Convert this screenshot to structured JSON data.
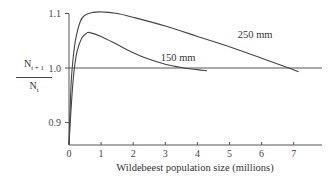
{
  "chart_data": {
    "type": "line",
    "title": "",
    "xlabel": "Wildebeest population size (millions)",
    "ylabel": {
      "numerator": "N",
      "numerator_sub": "t + 1",
      "denominator": "N",
      "denominator_sub": "t"
    },
    "xlim": [
      0,
      8
    ],
    "ylim": [
      0.86,
      1.1
    ],
    "xticks": [
      "0",
      "1",
      "2",
      "3",
      "4",
      "5",
      "6",
      "7"
    ],
    "yticks": [
      "0.9",
      "1.0",
      "1.1"
    ],
    "grid": false,
    "reference_line": {
      "y": 1.0,
      "x_range": [
        0,
        8
      ]
    },
    "series": [
      {
        "name": "250 mm",
        "x": [
          0,
          0.05,
          0.1,
          0.2,
          0.35,
          0.5,
          0.75,
          1.0,
          1.5,
          2.0,
          3.0,
          4.0,
          5.0,
          6.0,
          6.85,
          7.15
        ],
        "y": [
          0.86,
          0.95,
          1.0,
          1.05,
          1.085,
          1.097,
          1.102,
          1.103,
          1.1,
          1.093,
          1.077,
          1.058,
          1.039,
          1.018,
          1.0,
          0.993
        ]
      },
      {
        "name": "150 mm",
        "x": [
          0,
          0.08,
          0.15,
          0.25,
          0.4,
          0.55,
          0.65,
          1.0,
          1.5,
          2.0,
          2.5,
          3.0,
          3.5,
          4.0,
          4.3
        ],
        "y": [
          0.86,
          0.94,
          0.99,
          1.03,
          1.055,
          1.064,
          1.065,
          1.058,
          1.043,
          1.028,
          1.016,
          1.007,
          1.001,
          0.997,
          0.995
        ]
      }
    ],
    "annotations": [
      {
        "text": "250 mm",
        "x": 5.8,
        "y": 1.055
      },
      {
        "text": "150 mm",
        "x": 3.4,
        "y": 1.012
      }
    ]
  }
}
